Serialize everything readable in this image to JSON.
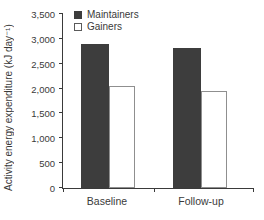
{
  "chart_data": {
    "type": "bar",
    "title": "",
    "xlabel": "",
    "ylabel": "Activity energy expenditure (kJ day⁻¹)",
    "categories": [
      "Baseline",
      "Follow-up"
    ],
    "series": [
      {
        "name": "Maintainers",
        "values": [
          2900,
          2825
        ],
        "fill": "#3d3d3d",
        "stroke": "#3d3d3d"
      },
      {
        "name": "Gainers",
        "values": [
          2050,
          1950
        ],
        "fill": "#ffffff",
        "stroke": "#8f8f8f"
      }
    ],
    "ylim": [
      0,
      3500
    ],
    "yticks": [
      {
        "label": "0",
        "value": 0
      },
      {
        "label": "500",
        "value": 500
      },
      {
        "label": "1,000",
        "value": 1000
      },
      {
        "label": "1,500",
        "value": 1500
      },
      {
        "label": "2,000",
        "value": 2000
      },
      {
        "label": "2,500",
        "value": 2500
      },
      {
        "label": "3,000",
        "value": 3000
      },
      {
        "label": "3,500",
        "value": 3500
      }
    ],
    "grid": false,
    "legend_position": "top-center"
  },
  "colors": {
    "axis": "#3a3a3a",
    "text": "#3a3a3a",
    "background": "#ffffff",
    "maintainers": "#3d3d3d",
    "gainers_outline": "#8f8f8f"
  }
}
